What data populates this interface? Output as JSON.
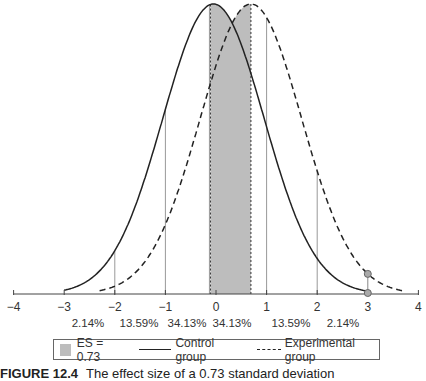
{
  "chart_data": {
    "type": "line",
    "title": "",
    "xlabel": "",
    "ylabel": "",
    "xlim": [
      -4,
      4
    ],
    "x_ticks": [
      -4,
      -3,
      -2,
      -1,
      0,
      1,
      2,
      3,
      4
    ],
    "x_tick_labels": [
      "−4",
      "−3",
      "−2",
      "−1",
      "0",
      "1",
      "2",
      "3",
      "4"
    ],
    "grid": false,
    "series": [
      {
        "name": "Control group",
        "style": "solid",
        "distribution": "normal",
        "mean": -0.05,
        "sd": 1.0,
        "x_range": [
          -3,
          3
        ]
      },
      {
        "name": "Experimental group",
        "style": "dashed",
        "distribution": "normal",
        "mean": 0.69,
        "sd": 1.0,
        "x_range": [
          -2.3,
          3.7
        ]
      }
    ],
    "shaded_region": {
      "label": "ES = 0.73",
      "x_start": -0.11,
      "x_end": 0.69,
      "color": "#bdbdbd"
    },
    "vertical_lines": [
      -2,
      -1,
      -0.13,
      1,
      2
    ],
    "markers": [
      {
        "x": 3,
        "on": "experimental curve"
      },
      {
        "x": 3,
        "on": "axis"
      }
    ],
    "area_labels": [
      "2.14%",
      "13.59%",
      "34.13%",
      "34.13%",
      "13.59%",
      "2.14%"
    ],
    "legend": [
      {
        "label": "ES = 0.73",
        "kind": "swatch"
      },
      {
        "label": "Control group",
        "kind": "solid"
      },
      {
        "label": "Experimental group",
        "kind": "dashed"
      }
    ],
    "legend_position": "bottom"
  },
  "caption": {
    "figure_number": "FIGURE 12.4",
    "text": "The effect size of a 0.73 standard deviation"
  }
}
